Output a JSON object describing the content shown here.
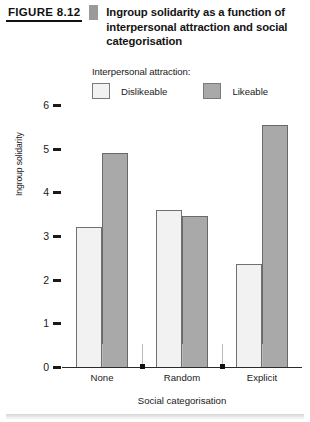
{
  "figure": {
    "number": "FIGURE 8.12",
    "caption": "Ingroup solidarity as a function of interpersonal attraction and social categorisation"
  },
  "legend": {
    "title": "Interpersonal attraction:",
    "entries": [
      {
        "label": "Dislikeable",
        "color": "#f2f2f2",
        "swatch_name": "legend-swatch-dislikeable"
      },
      {
        "label": "Likeable",
        "color": "#a9a9a9",
        "swatch_name": "legend-swatch-likeable"
      }
    ]
  },
  "chart_data": {
    "type": "bar",
    "title": "Ingroup solidarity as a function of interpersonal attraction and social categorisation",
    "xlabel": "Social categorisation",
    "ylabel": "Ingroup solidarity",
    "categories": [
      "None",
      "Random",
      "Explicit"
    ],
    "ylim": [
      0,
      6
    ],
    "yticks": [
      0,
      1,
      2,
      3,
      4,
      5,
      6
    ],
    "ytick_labels": [
      "0",
      "1",
      "2",
      "3",
      "4",
      "5",
      "6"
    ],
    "grid": false,
    "legend_position": "above-plot",
    "series": [
      {
        "name": "Dislikeable",
        "color": "#f2f2f2",
        "values": [
          3.2,
          3.6,
          2.35
        ]
      },
      {
        "name": "Likeable",
        "color": "#a9a9a9",
        "values": [
          4.9,
          3.45,
          5.55
        ]
      }
    ]
  }
}
